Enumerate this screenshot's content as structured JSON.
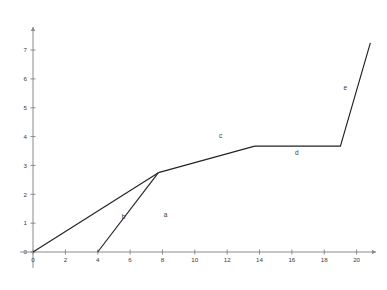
{
  "chart_data": {
    "type": "line",
    "title": "",
    "xlabel": "",
    "ylabel": "",
    "xlim": [
      -0.8,
      21.2
    ],
    "ylim": [
      -0.55,
      7.8
    ],
    "grid": false,
    "legend": "none",
    "x_ticks": [
      0,
      2,
      4,
      6,
      8,
      10,
      12,
      14,
      16,
      18,
      20
    ],
    "x_tick_labels": [
      "0",
      "2",
      "4",
      "6",
      "8",
      "10",
      "12",
      "14",
      "16",
      "18",
      "20"
    ],
    "y_ticks": [
      0,
      1,
      2,
      3,
      4,
      5,
      6,
      7
    ],
    "y_tick_labels": [
      "0",
      "1",
      "2",
      "3",
      "4",
      "5",
      "6",
      "7"
    ],
    "series": [
      {
        "name": "b",
        "label": "b",
        "label_x": 5.6,
        "label_y": 1.15,
        "points": [
          [
            0,
            0
          ],
          [
            7.75,
            2.75
          ]
        ]
      },
      {
        "name": "a",
        "label": "a",
        "label_x": 8.2,
        "label_y": 1.22,
        "points": [
          [
            4,
            0
          ],
          [
            7.75,
            2.75
          ]
        ]
      },
      {
        "name": "c-d-e",
        "label": "",
        "label_x": 0,
        "label_y": 0,
        "points": [
          [
            7.75,
            2.75
          ],
          [
            13.7,
            3.67
          ],
          [
            19.0,
            3.67
          ],
          [
            20.85,
            7.25
          ]
        ]
      }
    ],
    "segment_labels": [
      {
        "name": "a",
        "text": "a",
        "x": 8.2,
        "y": 1.22
      },
      {
        "name": "b",
        "text": "b",
        "x": 5.6,
        "y": 1.15
      },
      {
        "name": "c",
        "text": "c",
        "x": 11.6,
        "y": 3.96
      },
      {
        "name": "d",
        "text": "d",
        "x": 16.3,
        "y": 3.35
      },
      {
        "name": "e",
        "text": "e",
        "x": 19.3,
        "y": 5.62
      }
    ],
    "axis_color": "#8a8a8a",
    "line_color": "#222222",
    "text_color": "#3a3a3a",
    "background": "#ffffff"
  }
}
